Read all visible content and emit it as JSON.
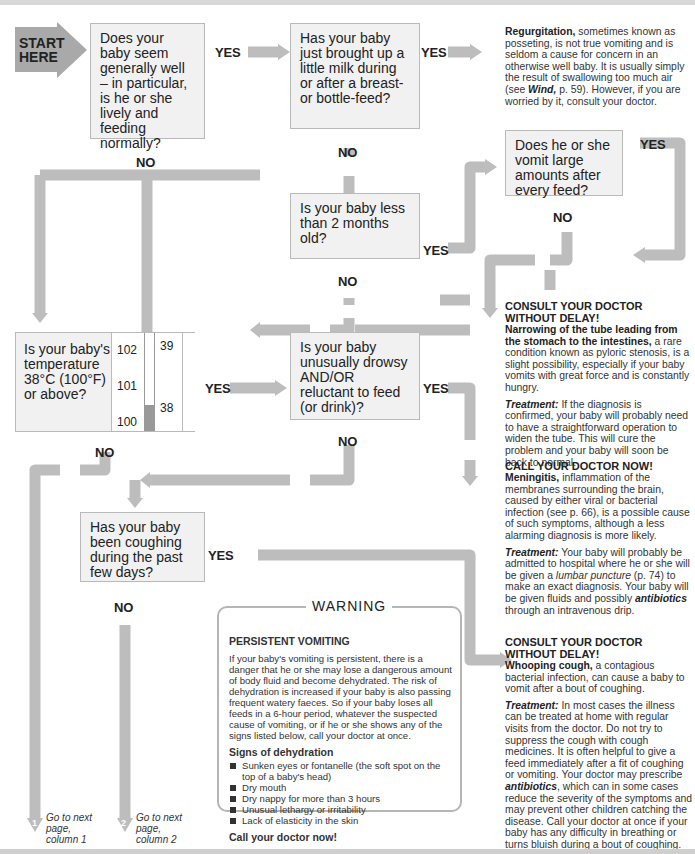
{
  "start": {
    "label": "START HERE"
  },
  "questions": {
    "q1": "Does your baby seem generally well – in particular, is he or she lively and feeding normally?",
    "q2": "Has your baby just brought up a little milk during or after a breast- or bottle-feed?",
    "q3": "Does he or she vomit large amounts after every feed?",
    "q4": "Is your baby less than 2 months old?",
    "q5": "Is your baby's temperature 38°C (100°F) or above?",
    "q6": "Is your baby unusually drowsy AND/OR reluctant to feed (or drink)?",
    "q7": "Has your baby been coughing during the past few days?"
  },
  "labels": {
    "yes": "YES",
    "no": "NO"
  },
  "thermometer": {
    "fahrenheit": [
      "102",
      "101",
      "100"
    ],
    "celsius": [
      "39",
      "38"
    ]
  },
  "outcomes": {
    "regurgitation": {
      "title": "Regurgitation,",
      "body": " sometimes known as posseting, is not true vomiting and is seldom a cause for concern in an otherwise well baby. It is usually simply the result of swallowing too much air (see ",
      "ref": "Wind,",
      "body2": " p. 59). However, if you are worried by it, consult your doctor."
    },
    "pyloric": {
      "heading": "CONSULT YOUR DOCTOR WITHOUT DELAY!",
      "title": "Narrowing of the tube leading from the stomach to the intestines,",
      "body": " a rare condition known as pyloric stenosis, is a slight possibility, especially if your baby vomits with great force and is constantly hungry.",
      "treatment_label": "Treatment:",
      "treatment": " If the diagnosis is confirmed, your baby will probably need to have a straightforward operation to widen the tube. This will cure the problem and your baby will soon be back to normal."
    },
    "meningitis": {
      "heading": "CALL YOUR DOCTOR NOW!",
      "title": "Meningitis,",
      "body": " inflammation of the membranes surrounding the brain, caused by either viral or bacterial infection (see p. 66), is a possible cause of such symptoms, although a less alarming diagnosis is more likely.",
      "treatment_label": "Treatment:",
      "treatment_a": " Your baby will probably be admitted to hospital where he or she will be given a ",
      "treatment_ref": "lumbar puncture",
      "treatment_b": " (p. 74) to make an exact diagnosis. Your baby will be given fluids and possibly ",
      "treatment_ref2": "antibiotics",
      "treatment_c": " through an intravenous drip."
    },
    "whooping": {
      "heading": "CONSULT YOUR DOCTOR WITHOUT DELAY!",
      "title": "Whooping cough,",
      "body": " a contagious bacterial infection, can cause a baby to vomit after a bout of coughing.",
      "treatment_label": "Treatment:",
      "treatment_a": " In most cases the illness can be treated at home with regular visits from the doctor. Do not try to suppress the cough with cough medicines. It is often helpful to give a feed immediately after a fit of coughing or vomiting. Your doctor may prescribe ",
      "treatment_ref": "antibiotics",
      "treatment_b": ", which can in some cases reduce the severity of the symptoms and may prevent other children catching the disease. Call your doctor at once if your baby has any difficulty in breathing or turns bluish during a bout of coughing."
    }
  },
  "warning": {
    "title": "WARNING",
    "heading": "PERSISTENT VOMITING",
    "body": "If your baby's vomiting is persistent, there is a danger that he or she may lose a dangerous amount of body fluid and become dehydrated. The risk of dehydration is increased if your baby is also passing frequent watery faeces. So if your baby loses all feeds in a 6-hour period, whatever the suspected cause of vomiting, or if he or she shows any of the signs listed below, call your doctor at once.",
    "signs_heading": "Signs of dehydration",
    "signs": [
      "Sunken eyes or fontanelle (the soft spot on the top of a baby's head)",
      "Dry mouth",
      "Dry nappy for more than 3 hours",
      "Unusual lethargy or irritability",
      "Lack of elasticity in the skin"
    ],
    "footer": "Call your doctor now!"
  },
  "goto": {
    "col1": {
      "num": "1",
      "text": "Go to next page, column 1"
    },
    "col2": {
      "num": "2",
      "text": "Go to next page, column 2"
    }
  },
  "colors": {
    "arrow": "#bdbdbd",
    "box": "#f1f1f1",
    "box_border": "#b9b9b9",
    "start": "#a9a9a9"
  }
}
